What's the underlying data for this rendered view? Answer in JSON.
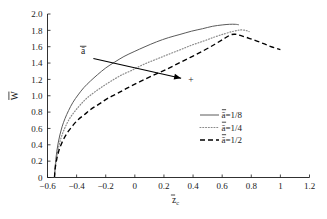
{
  "chart_data": {
    "type": "line",
    "title": "",
    "xlabel": "z̄c",
    "ylabel": "W̄",
    "xlim": [
      -0.6,
      1.2
    ],
    "ylim": [
      0,
      2.0
    ],
    "xticks": [
      -0.6,
      -0.4,
      -0.2,
      0,
      0.2,
      0.4,
      0.6,
      0.8,
      1,
      1.2
    ],
    "xticklabels": [
      "-0.6",
      "-0.4",
      "-0.2",
      "0",
      "0.2",
      "0.4",
      "0.6",
      "0.8",
      "1",
      "1.2"
    ],
    "yticks": [
      0,
      0.2,
      0.4,
      0.6,
      0.8,
      1.0,
      1.2,
      1.4,
      1.6,
      1.8,
      2.0
    ],
    "yticklabels": [
      "0",
      "0.2",
      "0.4",
      "0.6",
      "0.8",
      "1.0",
      "1.2",
      "1.4",
      "1.6",
      "1.8",
      "2.0"
    ],
    "grid": false,
    "legend_position": "center-right",
    "series": [
      {
        "name": "ā=1/8",
        "style": "solid",
        "color": "#5a5a5a",
        "points": [
          [
            -0.552,
            0.0
          ],
          [
            -0.548,
            0.12
          ],
          [
            -0.543,
            0.22
          ],
          [
            -0.536,
            0.32
          ],
          [
            -0.527,
            0.42
          ],
          [
            -0.515,
            0.52
          ],
          [
            -0.5,
            0.62
          ],
          [
            -0.48,
            0.72
          ],
          [
            -0.455,
            0.82
          ],
          [
            -0.425,
            0.92
          ],
          [
            -0.39,
            1.01
          ],
          [
            -0.35,
            1.1
          ],
          [
            -0.305,
            1.18
          ],
          [
            -0.255,
            1.26
          ],
          [
            -0.2,
            1.34
          ],
          [
            -0.14,
            1.41
          ],
          [
            -0.075,
            1.48
          ],
          [
            -0.005,
            1.54
          ],
          [
            0.07,
            1.6
          ],
          [
            0.15,
            1.66
          ],
          [
            0.23,
            1.71
          ],
          [
            0.31,
            1.75
          ],
          [
            0.39,
            1.79
          ],
          [
            0.465,
            1.82
          ],
          [
            0.535,
            1.85
          ],
          [
            0.6,
            1.866
          ],
          [
            0.65,
            1.874
          ],
          [
            0.69,
            1.874
          ],
          [
            0.715,
            1.868
          ]
        ]
      },
      {
        "name": "ā=1/4",
        "style": "dotted",
        "color": "#8a8a8a",
        "points": [
          [
            -0.552,
            0.0
          ],
          [
            -0.548,
            0.1
          ],
          [
            -0.542,
            0.19
          ],
          [
            -0.534,
            0.28
          ],
          [
            -0.524,
            0.37
          ],
          [
            -0.511,
            0.46
          ],
          [
            -0.494,
            0.55
          ],
          [
            -0.472,
            0.64
          ],
          [
            -0.445,
            0.73
          ],
          [
            -0.412,
            0.81
          ],
          [
            -0.374,
            0.89
          ],
          [
            -0.33,
            0.97
          ],
          [
            -0.28,
            1.04
          ],
          [
            -0.224,
            1.11
          ],
          [
            -0.162,
            1.18
          ],
          [
            -0.095,
            1.25
          ],
          [
            -0.022,
            1.31
          ],
          [
            0.056,
            1.38
          ],
          [
            0.138,
            1.44
          ],
          [
            0.222,
            1.5
          ],
          [
            0.308,
            1.56
          ],
          [
            0.392,
            1.62
          ],
          [
            0.474,
            1.67
          ],
          [
            0.55,
            1.72
          ],
          [
            0.62,
            1.76
          ],
          [
            0.68,
            1.79
          ],
          [
            0.725,
            1.805
          ],
          [
            0.76,
            1.8
          ],
          [
            0.785,
            1.785
          ]
        ]
      },
      {
        "name": "ā=1/2",
        "style": "dashed",
        "color": "#000000",
        "points": [
          [
            -0.552,
            0.0
          ],
          [
            -0.549,
            0.08
          ],
          [
            -0.544,
            0.15
          ],
          [
            -0.537,
            0.22
          ],
          [
            -0.528,
            0.29
          ],
          [
            -0.516,
            0.36
          ],
          [
            -0.5,
            0.43
          ],
          [
            -0.48,
            0.5
          ],
          [
            -0.455,
            0.57
          ],
          [
            -0.424,
            0.64
          ],
          [
            -0.388,
            0.71
          ],
          [
            -0.346,
            0.77
          ],
          [
            -0.298,
            0.84
          ],
          [
            -0.244,
            0.9
          ],
          [
            -0.184,
            0.97
          ],
          [
            -0.118,
            1.03
          ],
          [
            -0.046,
            1.1
          ],
          [
            0.032,
            1.17
          ],
          [
            0.115,
            1.24
          ],
          [
            0.202,
            1.31
          ],
          [
            0.292,
            1.39
          ],
          [
            0.382,
            1.47
          ],
          [
            0.47,
            1.55
          ],
          [
            0.55,
            1.63
          ],
          [
            0.615,
            1.7
          ],
          [
            0.658,
            1.745
          ],
          [
            0.69,
            1.752
          ],
          [
            0.73,
            1.735
          ],
          [
            0.79,
            1.7
          ],
          [
            0.86,
            1.655
          ],
          [
            0.93,
            1.605
          ],
          [
            1.0,
            1.565
          ]
        ]
      }
    ],
    "annotations": [
      {
        "name": "a-bar-annotation",
        "label": "ā",
        "label_x": -0.355,
        "label_y": 1.505,
        "arrow_from_x": -0.285,
        "arrow_from_y": 1.455,
        "arrow_to_x": 0.318,
        "arrow_to_y": 1.215
      },
      {
        "name": "plus-marker",
        "label": "+",
        "x": 0.385,
        "y": 1.195
      }
    ]
  },
  "legend": {
    "entries": [
      {
        "label": "ā=1/8",
        "style": "solid"
      },
      {
        "label": "ā=1/4",
        "style": "dotted"
      },
      {
        "label": "ā=1/2",
        "style": "dashed"
      }
    ]
  },
  "axes": {
    "x_title": "z̄c",
    "y_title": "W̄"
  }
}
